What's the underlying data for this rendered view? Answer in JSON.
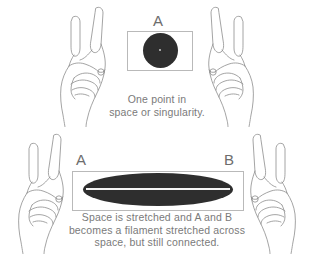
{
  "figure": {
    "background_color": "#ffffff",
    "ink_color": "#6d6d6d",
    "mass_color": "#2e2e2e",
    "box_border_color": "#b9b9b9"
  },
  "panels": [
    {
      "id": "top",
      "label": "A",
      "box_label": "A",
      "mass_shape": "circle",
      "caption_lines": [
        "One point in",
        "space or singularity."
      ]
    },
    {
      "id": "bottom",
      "left_label": "A",
      "right_label": "B",
      "mass_shape": "ellipse",
      "caption_lines": [
        "Space is stretched and A and B",
        "becomes a filament stretched across",
        "space, but still connected."
      ]
    }
  ],
  "hands": [
    {
      "id": "top-left",
      "side": "left",
      "gesture": "pinch"
    },
    {
      "id": "top-right",
      "side": "right",
      "gesture": "pinch"
    },
    {
      "id": "bottom-left",
      "side": "left",
      "gesture": "pinch"
    },
    {
      "id": "bottom-right",
      "side": "right",
      "gesture": "pinch"
    }
  ]
}
